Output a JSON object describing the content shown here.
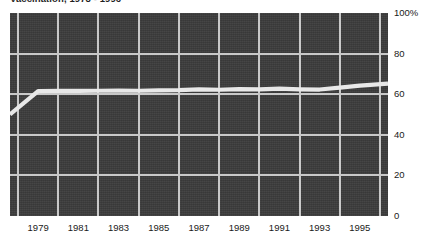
{
  "chart_data": {
    "type": "line",
    "title": "Vaccination, 1978 - 1996",
    "xlabel": "",
    "ylabel": "",
    "xlim": [
      1977.6,
      1996.4
    ],
    "ylim": [
      0,
      100
    ],
    "grid": true,
    "legend": false,
    "y_ticks": [
      {
        "value": 100,
        "label": "100%"
      },
      {
        "value": 80,
        "label": "80"
      },
      {
        "value": 60,
        "label": "60"
      },
      {
        "value": 40,
        "label": "40"
      },
      {
        "value": 20,
        "label": "20"
      },
      {
        "value": 0,
        "label": "0"
      }
    ],
    "x_ticks": [
      {
        "value": 1979,
        "label": "1979"
      },
      {
        "value": 1981,
        "label": "1981"
      },
      {
        "value": 1983,
        "label": "1983"
      },
      {
        "value": 1985,
        "label": "1985"
      },
      {
        "value": 1987,
        "label": "1987"
      },
      {
        "value": 1989,
        "label": "1989"
      },
      {
        "value": 1991,
        "label": "1991"
      },
      {
        "value": 1993,
        "label": "1993"
      },
      {
        "value": 1995,
        "label": "1995"
      }
    ],
    "x_gridlines": [
      1978,
      1980,
      1982,
      1984,
      1986,
      1988,
      1990,
      1992,
      1994,
      1996
    ],
    "y_gridlines": [
      20,
      40,
      60,
      80
    ],
    "series": [
      {
        "name": "Coverage",
        "color": "#e8e8e8",
        "x": [
          1977.6,
          1979,
          1980,
          1981,
          1982,
          1983,
          1984,
          1985,
          1986,
          1987,
          1988,
          1989,
          1990,
          1991,
          1992,
          1993,
          1994,
          1995,
          1996.4
        ],
        "values": [
          50,
          61.5,
          61.7,
          61.6,
          61.7,
          61.8,
          61.7,
          61.9,
          62.0,
          62.4,
          62.2,
          62.5,
          62.4,
          62.7,
          62.4,
          62.3,
          63.2,
          64.2,
          65.2
        ]
      }
    ],
    "colors": {
      "plot_background": "#3b3b3b",
      "gridline": "#c9c9c9",
      "line": "#e8e8e8",
      "page_background": "#ffffff",
      "text": "#1a1a1a"
    }
  }
}
